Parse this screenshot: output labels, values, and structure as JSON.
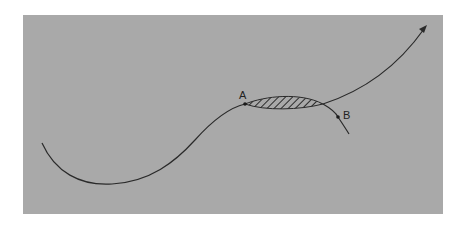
{
  "diagram": {
    "background_color": "#a9a9a9",
    "line_color": "#2a2a2a",
    "hatch_color": "#2a2a2a",
    "points": [
      {
        "id": "A",
        "label": "A",
        "x": 245,
        "y": 104
      },
      {
        "id": "B",
        "label": "B",
        "x": 338,
        "y": 117
      }
    ],
    "curves": [
      {
        "name": "main-curve",
        "description": "S-shaped curve rising from lower left to point A, continuing along upper edge of shaded region and rising to arrowhead at upper right"
      },
      {
        "name": "branch-curve",
        "description": "Lower edge of shaded region from A, passing through B and descending"
      }
    ],
    "shaded_region": {
      "description": "Hatched lens-shaped region between the two curves, from A to their intersection",
      "pattern": "diagonal-hatch"
    }
  }
}
